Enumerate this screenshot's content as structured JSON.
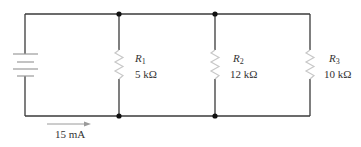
{
  "diagram": {
    "type": "parallel-circuit",
    "source": {
      "kind": "battery",
      "icon": "battery-icon"
    },
    "total_current": {
      "label": "15 mA",
      "direction": "right"
    },
    "resistors": [
      {
        "name_letter": "R",
        "name_sub": "1",
        "value": "5 kΩ"
      },
      {
        "name_letter": "R",
        "name_sub": "2",
        "value": "12 kΩ"
      },
      {
        "name_letter": "R",
        "name_sub": "3",
        "value": "10 kΩ"
      }
    ],
    "colors": {
      "wire": "#3a3a3a",
      "resistor": "#c8c8c8",
      "junction": "#111111",
      "label": "#333333"
    }
  }
}
